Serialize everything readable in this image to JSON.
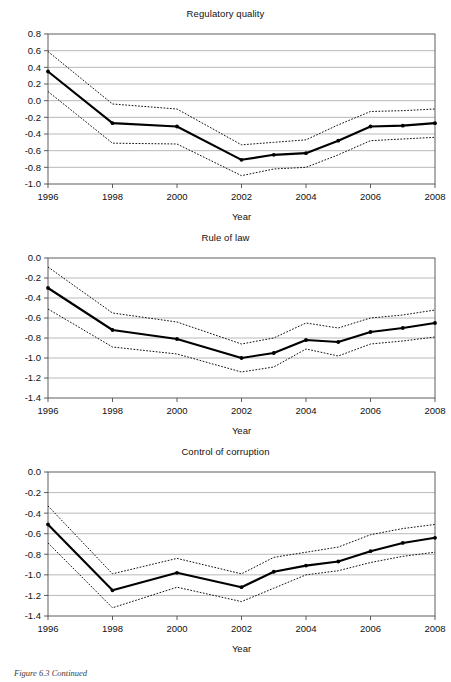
{
  "figure": {
    "caption": "Figure 6.3 Continued",
    "shared_xlabel": "Year",
    "xticks": [
      "1996",
      "1998",
      "2000",
      "2002",
      "2004",
      "2006",
      "2008"
    ]
  },
  "chart_data": [
    {
      "type": "line",
      "title": "Regulatory quality",
      "xlabel": "Year",
      "ylabel": "",
      "x": [
        1996,
        1998,
        2000,
        2002,
        2003,
        2004,
        2005,
        2006,
        2007,
        2008
      ],
      "xlim": [
        1996,
        2008
      ],
      "ylim": [
        -1.0,
        0.8
      ],
      "yticks": [
        0.8,
        0.6,
        0.4,
        0.2,
        0.0,
        -0.2,
        -0.4,
        -0.6,
        -0.8,
        -1.0
      ],
      "ytick_labels": [
        "0.8",
        "0.6",
        "0.4",
        "0.2",
        "0.0",
        "-0.2",
        "-0.4",
        "-0.6",
        "-0.8",
        "-1.0"
      ],
      "grid": true,
      "legend": "none",
      "series": [
        {
          "name": "Estimate",
          "style": "solid",
          "markers": true,
          "values": [
            0.35,
            -0.27,
            -0.31,
            -0.71,
            -0.65,
            -0.63,
            -0.48,
            -0.31,
            -0.3,
            -0.27
          ]
        },
        {
          "name": "Upper confidence bound",
          "style": "dotted",
          "markers": false,
          "values": [
            0.59,
            -0.04,
            -0.1,
            -0.53,
            -0.5,
            -0.47,
            -0.29,
            -0.13,
            -0.12,
            -0.1
          ]
        },
        {
          "name": "Lower confidence bound",
          "style": "dotted",
          "markers": false,
          "values": [
            0.11,
            -0.51,
            -0.52,
            -0.9,
            -0.82,
            -0.8,
            -0.65,
            -0.48,
            -0.46,
            -0.44
          ]
        }
      ]
    },
    {
      "type": "line",
      "title": "Rule of law",
      "xlabel": "Year",
      "ylabel": "",
      "x": [
        1996,
        1998,
        2000,
        2002,
        2003,
        2004,
        2005,
        2006,
        2007,
        2008
      ],
      "xlim": [
        1996,
        2008
      ],
      "ylim": [
        -1.4,
        0.0
      ],
      "yticks": [
        0.0,
        -0.2,
        -0.4,
        -0.6,
        -0.8,
        -1.0,
        -1.2,
        -1.4
      ],
      "ytick_labels": [
        "0.0",
        "-0.2",
        "-0.4",
        "-0.6",
        "-0.8",
        "-1.0",
        "-1.2",
        "-1.4"
      ],
      "grid": true,
      "legend": "none",
      "series": [
        {
          "name": "Estimate",
          "style": "solid",
          "markers": true,
          "values": [
            -0.3,
            -0.72,
            -0.81,
            -1.0,
            -0.95,
            -0.82,
            -0.84,
            -0.74,
            -0.7,
            -0.65
          ]
        },
        {
          "name": "Upper confidence bound",
          "style": "dotted",
          "markers": false,
          "values": [
            -0.09,
            -0.55,
            -0.64,
            -0.86,
            -0.8,
            -0.65,
            -0.7,
            -0.6,
            -0.57,
            -0.52
          ]
        },
        {
          "name": "Lower confidence bound",
          "style": "dotted",
          "markers": false,
          "values": [
            -0.51,
            -0.89,
            -0.96,
            -1.14,
            -1.09,
            -0.91,
            -0.98,
            -0.86,
            -0.83,
            -0.79
          ]
        }
      ]
    },
    {
      "type": "line",
      "title": "Control of corruption",
      "xlabel": "Year",
      "ylabel": "",
      "x": [
        1996,
        1998,
        2000,
        2002,
        2003,
        2004,
        2005,
        2006,
        2007,
        2008
      ],
      "xlim": [
        1996,
        2008
      ],
      "ylim": [
        -1.4,
        0.0
      ],
      "yticks": [
        0.0,
        -0.2,
        -0.4,
        -0.6,
        -0.8,
        -1.0,
        -1.2,
        -1.4
      ],
      "ytick_labels": [
        "0.0",
        "-0.2",
        "-0.4",
        "-0.6",
        "-0.8",
        "-1.0",
        "-1.2",
        "-1.4"
      ],
      "grid": true,
      "legend": "none",
      "series": [
        {
          "name": "Estimate",
          "style": "solid",
          "markers": true,
          "values": [
            -0.51,
            -1.15,
            -0.98,
            -1.12,
            -0.97,
            -0.91,
            -0.87,
            -0.77,
            -0.69,
            -0.64
          ]
        },
        {
          "name": "Upper confidence bound",
          "style": "dotted",
          "markers": false,
          "values": [
            -0.33,
            -0.99,
            -0.84,
            -0.99,
            -0.83,
            -0.78,
            -0.73,
            -0.61,
            -0.55,
            -0.51
          ]
        },
        {
          "name": "Lower confidence bound",
          "style": "dotted",
          "markers": false,
          "values": [
            -0.69,
            -1.32,
            -1.12,
            -1.26,
            -1.13,
            -1.0,
            -0.96,
            -0.88,
            -0.82,
            -0.78
          ]
        }
      ]
    }
  ]
}
